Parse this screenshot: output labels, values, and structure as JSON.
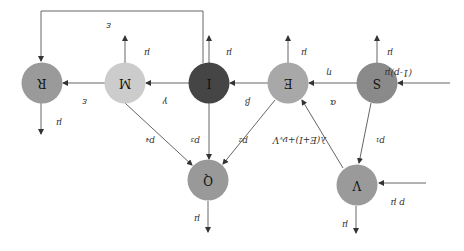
{
  "orientation": "rotated-180",
  "nodes": [
    {
      "id": "S",
      "label": "S",
      "cx": 377,
      "cy": 83,
      "color": "#8a8a8a"
    },
    {
      "id": "E",
      "label": "E",
      "cx": 288,
      "cy": 83,
      "color": "#a8a8a8"
    },
    {
      "id": "I",
      "label": "I",
      "cx": 209,
      "cy": 83,
      "color": "#454545"
    },
    {
      "id": "M",
      "label": "M",
      "cx": 125,
      "cy": 83,
      "color": "#cccccc"
    },
    {
      "id": "R",
      "label": "R",
      "cx": 42,
      "cy": 83,
      "color": "#9a9a9a"
    },
    {
      "id": "Q",
      "label": "Q",
      "cx": 208,
      "cy": 180,
      "color": "#999999"
    },
    {
      "id": "V",
      "label": "V",
      "cx": 357,
      "cy": 185,
      "color": "#9a9a9a"
    }
  ],
  "labels": {
    "s_input": "(1-p)μ",
    "v_input": "p μ",
    "s_to_e_alpha": "α",
    "s_to_e_eta": "η",
    "e_to_i": "β",
    "i_to_m": "γ",
    "m_to_r": "ε",
    "i_to_r": "ε",
    "s_to_v": "p₁",
    "v_to_e": "λ(E+I)+νᵥV",
    "e_to_q": "p₂",
    "i_to_q": "p₃",
    "m_to_q": "p₄",
    "death_s": "μ",
    "death_e": "μ",
    "death_i": "μ",
    "death_m": "μ",
    "death_r": "μ",
    "death_q": "μ",
    "death_v": "μ"
  }
}
